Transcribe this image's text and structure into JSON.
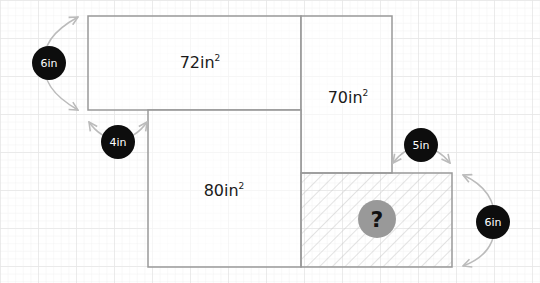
{
  "diagram": {
    "colors": {
      "background": "#ffffff",
      "grid_minor": "#f0f0f0",
      "grid_major": "#e4e4e4",
      "rect_stroke": "#999999",
      "hatch": "#cccccc",
      "badge_fill": "#0d0d0d",
      "badge_text": "#ffffff",
      "arrow": "#bbbbbb",
      "question_fill": "#999999",
      "question_text": "#111111"
    },
    "areas": [
      {
        "id": "top",
        "value": "72in",
        "sup": "2"
      },
      {
        "id": "right",
        "value": "70in",
        "sup": "2"
      },
      {
        "id": "bottom",
        "value": "80in",
        "sup": "2"
      }
    ],
    "unknown": {
      "label": "?"
    },
    "dimensions": [
      {
        "id": "left-6",
        "label": "6in"
      },
      {
        "id": "gap-4",
        "label": "4in"
      },
      {
        "id": "gap-5",
        "label": "5in"
      },
      {
        "id": "right-6",
        "label": "6in"
      }
    ]
  }
}
